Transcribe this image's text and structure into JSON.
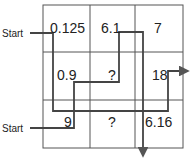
{
  "grid": {
    "rows": [
      [
        "0.125",
        "6.1",
        "7"
      ],
      [
        "0.9",
        "?",
        "18"
      ],
      [
        "9",
        "?",
        "6.16"
      ]
    ]
  },
  "labels": {
    "start_top": "Start",
    "start_bottom": "Start"
  },
  "colors": {
    "grid_line": "#555555",
    "path_line": "#444444",
    "text": "#222222"
  }
}
